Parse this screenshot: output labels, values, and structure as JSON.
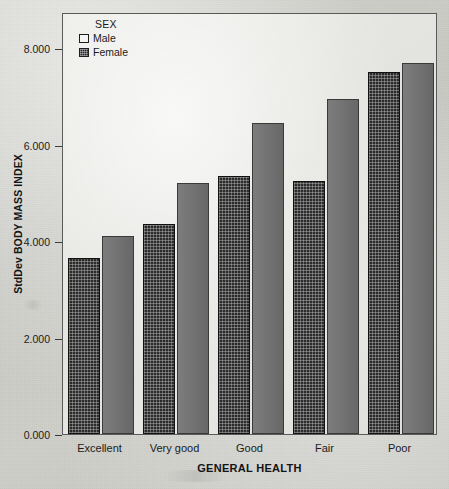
{
  "chart_data": {
    "type": "bar",
    "title": "",
    "subtitle": "",
    "xlabel": "GENERAL HEALTH",
    "ylabel": "StdDev BODY MASS INDEX",
    "categories": [
      "Excellent",
      "Very good",
      "Good",
      "Fair",
      "Poor"
    ],
    "series": [
      {
        "name": "Male",
        "values": [
          3.65,
          4.35,
          5.36,
          5.25,
          7.5
        ]
      },
      {
        "name": "Female",
        "values": [
          4.11,
          5.21,
          6.44,
          6.95,
          7.7
        ]
      }
    ],
    "ylim": [
      0,
      8.75
    ],
    "yticks": [
      0,
      2,
      4,
      6,
      8
    ],
    "ytick_labels": [
      "0.000",
      "2.000",
      "4.000",
      "6.000",
      "8.000"
    ],
    "grid": false,
    "legend": {
      "title": "SEX",
      "position": "top-left-inside",
      "entries": [
        {
          "label": "Male",
          "swatch": "male",
          "color": "#2b2b2b"
        },
        {
          "label": "Female",
          "swatch": "female",
          "color": "#6e6e6e"
        }
      ]
    },
    "colors": {
      "male_bar": "#2b2b2b",
      "female_bar": "#6e6e6e",
      "plot_background": "#e6e6e2",
      "page_background": "#cfcfca",
      "axis": "#3b3b39",
      "text": "#1b1b1b"
    }
  }
}
